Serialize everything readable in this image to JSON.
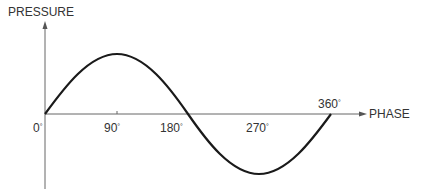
{
  "diagram": {
    "y_axis_label": "PRESSURE",
    "x_axis_label": "PHASE",
    "ticks": [
      {
        "value": "0",
        "unit": "°"
      },
      {
        "value": "90",
        "unit": "°"
      },
      {
        "value": "180",
        "unit": "°"
      },
      {
        "value": "270",
        "unit": "°"
      },
      {
        "value": "360",
        "unit": "°"
      }
    ],
    "curve": {
      "type": "sine",
      "period_deg": 360,
      "start_deg": 0,
      "end_deg": 360
    },
    "colors": {
      "curve": "#1a1a1a",
      "axis": "#555555",
      "text": "#333333"
    }
  }
}
